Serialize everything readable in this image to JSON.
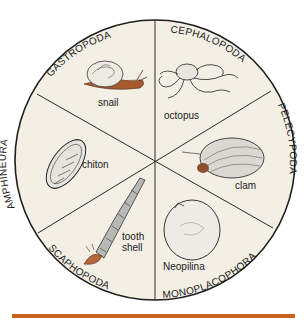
{
  "diagram": {
    "type": "pie-division",
    "classes": [
      {
        "name": "GASTROPODA",
        "example": "snail"
      },
      {
        "name": "CEPHALOPODA",
        "example": "octopus"
      },
      {
        "name": "PELECYPODA",
        "example": "clam"
      },
      {
        "name": "MONOPLACOPHORA",
        "example": "Neopilina"
      },
      {
        "name": "SCAPHOPODA",
        "example_line1": "tooth",
        "example_line2": "shell"
      },
      {
        "name": "AMPHINEURA",
        "example": "chiton"
      }
    ]
  },
  "colors": {
    "circle_fill": "#f3efe5",
    "outline": "#1f1f1f",
    "accent_rule": "#c8621c",
    "snail_body": "#a65a2c",
    "tooth_shell_foot": "#b5653a"
  }
}
